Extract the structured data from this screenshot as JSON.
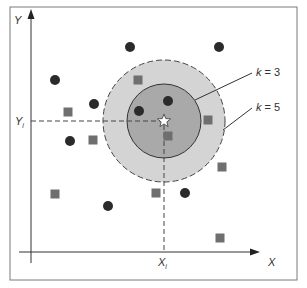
{
  "diagram": {
    "axes": {
      "x_label": "X",
      "y_label": "Y",
      "query_x_label": "X",
      "query_x_sub": "i",
      "query_y_label": "Y",
      "query_y_sub": "i"
    },
    "query_point": {
      "shape": "star-icon",
      "x": 164,
      "y": 121
    },
    "neighborhoods": [
      {
        "label_k": "k",
        "label_eq": " = 3",
        "radius": 37,
        "fill": "#a9a9a9",
        "stroke_style": "solid"
      },
      {
        "label_k": "k",
        "label_eq": " = 5",
        "radius": 61,
        "fill": "#d4d4d4",
        "stroke_style": "dashed"
      }
    ],
    "class_circle": {
      "name": "circle class",
      "color": "#2b2b2b",
      "points": [
        [
          130,
          47
        ],
        [
          219,
          47
        ],
        [
          55,
          80
        ],
        [
          94,
          104
        ],
        [
          139,
          111
        ],
        [
          168,
          101
        ],
        [
          70,
          141
        ],
        [
          185,
          193
        ],
        [
          108,
          206
        ]
      ]
    },
    "class_square": {
      "name": "square class",
      "color": "#6f6f6f",
      "points": [
        [
          68,
          112
        ],
        [
          93,
          140
        ],
        [
          138,
          80
        ],
        [
          208,
          120
        ],
        [
          168,
          136
        ],
        [
          222,
          167
        ],
        [
          55,
          194
        ],
        [
          156,
          193
        ],
        [
          220,
          238
        ]
      ]
    },
    "colors": {
      "frame": "#7a7a7a",
      "axis": "#333333",
      "outer_fill": "#d4d4d4",
      "inner_fill": "#a9a9a9"
    }
  }
}
